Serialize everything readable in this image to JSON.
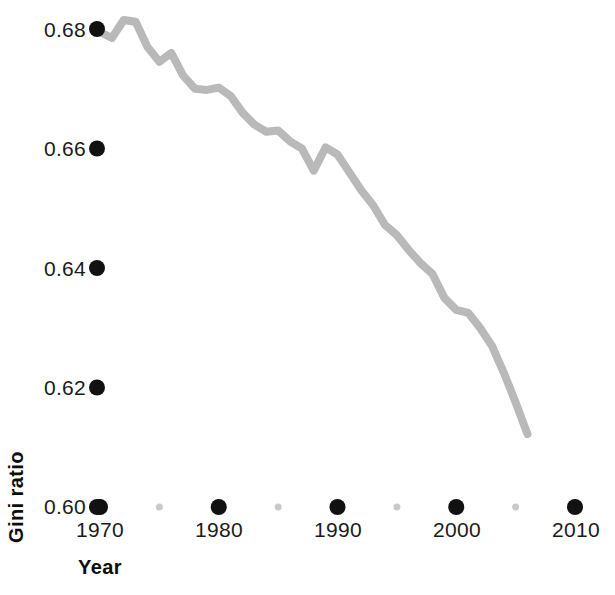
{
  "chart_data": {
    "type": "line",
    "title": "",
    "subtitle": "",
    "xlabel": "Year",
    "ylabel": "Gini ratio",
    "xlim": [
      1969,
      2011
    ],
    "ylim": [
      0.596,
      0.6825
    ],
    "grid": false,
    "legend": "none",
    "line_color": "#b9b9b9",
    "line_width": 8,
    "tick_color_major": "#111111",
    "tick_color_minor": "#c9c9c9",
    "x_ticks_major": [
      "1970",
      "1980",
      "1990",
      "2000",
      "2010"
    ],
    "x_ticks_major_values": [
      1970,
      1980,
      1990,
      2000,
      2010
    ],
    "x_ticks_minor_values": [
      1975,
      1985,
      1995,
      2005
    ],
    "y_ticks": [
      "0.60",
      "0.62",
      "0.64",
      "0.66",
      "0.68"
    ],
    "y_ticks_values": [
      0.6,
      0.62,
      0.64,
      0.66,
      0.68
    ],
    "series": [
      {
        "name": "Gini ratio",
        "x": [
          1970,
          1971,
          1972,
          1973,
          1974,
          1975,
          1976,
          1977,
          1978,
          1979,
          1980,
          1981,
          1982,
          1983,
          1984,
          1985,
          1986,
          1987,
          1988,
          1989,
          1990,
          1991,
          1992,
          1993,
          1994,
          1995,
          1996,
          1997,
          1998,
          1999,
          2000,
          2001,
          2002,
          2003,
          2004,
          2005,
          2006
        ],
        "y": [
          0.6795,
          0.6785,
          0.6815,
          0.6812,
          0.677,
          0.6745,
          0.676,
          0.6722,
          0.67,
          0.6698,
          0.6702,
          0.6688,
          0.666,
          0.664,
          0.6628,
          0.663,
          0.6612,
          0.66,
          0.6563,
          0.6602,
          0.659,
          0.656,
          0.653,
          0.6505,
          0.6472,
          0.6455,
          0.643,
          0.6408,
          0.639,
          0.635,
          0.633,
          0.6325,
          0.63,
          0.627,
          0.6225,
          0.6175,
          0.6122
        ]
      }
    ]
  },
  "axis": {
    "y_title": "Gini ratio",
    "x_title": "Year"
  },
  "y_tick_labels": [
    "0.68",
    "0.66",
    "0.64",
    "0.62",
    "0.60"
  ],
  "x_tick_labels": [
    "1970",
    "1980",
    "1990",
    "2000",
    "2010"
  ]
}
